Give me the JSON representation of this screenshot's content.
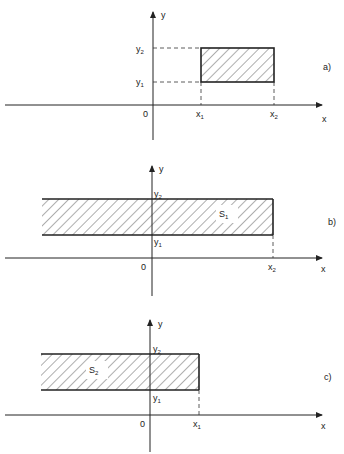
{
  "panels": [
    {
      "id": "a",
      "label": "a)",
      "axis_x_label": "x",
      "axis_y_label": "y",
      "origin_label": "0",
      "x_ticks": [
        {
          "base": "x",
          "sub": "1"
        },
        {
          "base": "x",
          "sub": "2"
        }
      ],
      "y_ticks": [
        {
          "base": "y",
          "sub": "1"
        },
        {
          "base": "y",
          "sub": "2"
        }
      ],
      "region_label": ""
    },
    {
      "id": "b",
      "label": "b)",
      "axis_x_label": "x",
      "axis_y_label": "y",
      "origin_label": "0",
      "x_ticks": [
        {
          "base": "x",
          "sub": "2"
        }
      ],
      "y_ticks": [
        {
          "base": "y",
          "sub": "1"
        },
        {
          "base": "y",
          "sub": "2"
        }
      ],
      "region_label": {
        "base": "S",
        "sub": "1"
      }
    },
    {
      "id": "c",
      "label": "c)",
      "axis_x_label": "x",
      "axis_y_label": "y",
      "origin_label": "0",
      "x_ticks": [
        {
          "base": "x",
          "sub": "1"
        }
      ],
      "y_ticks": [
        {
          "base": "y",
          "sub": "1"
        },
        {
          "base": "y",
          "sub": "2"
        }
      ],
      "region_label": {
        "base": "S",
        "sub": "2"
      }
    }
  ],
  "colors": {
    "ink": "#222222",
    "background": "#ffffff"
  }
}
